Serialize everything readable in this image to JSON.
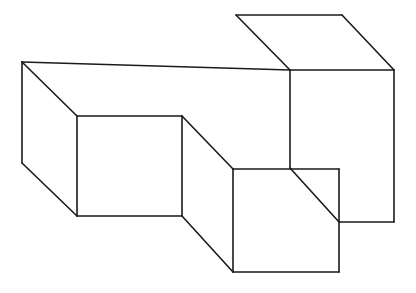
{
  "document": {
    "title": "Isometric Block Line Drawing",
    "background_color": "#ffffff",
    "line_color": "#1a1a1a",
    "fill_color": "#ffffff",
    "stroke_width": 1.6,
    "width": 416,
    "height": 293,
    "subject": "three-dimensional stepped rectangular solid drawn in oblique projection",
    "text_content": ""
  },
  "figure": {
    "name": "stepped-block-solid",
    "projection": "oblique / parallel",
    "vertices": {
      "A": [
        22,
        62
      ],
      "B": [
        77,
        116
      ],
      "C": [
        182,
        116
      ],
      "D": [
        233,
        169
      ],
      "E": [
        290,
        70
      ],
      "F": [
        236,
        15
      ],
      "G": [
        342,
        15
      ],
      "H": [
        394,
        70
      ],
      "I": [
        22,
        163
      ],
      "J": [
        77,
        216
      ],
      "K": [
        182,
        216
      ],
      "L": [
        233,
        272
      ],
      "M": [
        339,
        272
      ],
      "N": [
        339,
        222
      ],
      "O": [
        394,
        222
      ],
      "P": [
        339,
        169
      ]
    },
    "faces": [
      {
        "name": "top-left-plateau-face",
        "points": "22,62 290,70 236,15"
      },
      {
        "name": "upper-block-top-face",
        "points": "236,15 342,15 394,70 290,70"
      },
      {
        "name": "left-front-face",
        "points": "77,116 182,116 182,216 77,216"
      },
      {
        "name": "left-side-face",
        "points": "22,62 77,116 77,216 22,163"
      },
      {
        "name": "middle-front-face",
        "points": "233,169 339,169 339,272 233,272"
      },
      {
        "name": "middle-side-face",
        "points": "182,116 233,169 233,272 182,216"
      },
      {
        "name": "right-block-front-face",
        "points": "290,70 394,70 394,222 339,222 339,169"
      }
    ],
    "edges": [
      {
        "name": "edge-A-B",
        "from": "A",
        "to": "B",
        "d": "M 22 62 L 77 116"
      },
      {
        "name": "edge-A-I",
        "from": "A",
        "to": "I",
        "d": "M 22 62 L 22 163"
      },
      {
        "name": "edge-A-E-top-left-plateau",
        "from": "A",
        "to": "E",
        "d": "M 22 62 L 290 70"
      },
      {
        "name": "edge-I-J",
        "from": "I",
        "to": "J",
        "d": "M 22 163 L 77 216"
      },
      {
        "name": "edge-B-C",
        "from": "B",
        "to": "C",
        "d": "M 77 116 L 182 116"
      },
      {
        "name": "edge-B-J",
        "from": "B",
        "to": "J",
        "d": "M 77 116 L 77 216"
      },
      {
        "name": "edge-J-K",
        "from": "J",
        "to": "K",
        "d": "M 77 216 L 182 216"
      },
      {
        "name": "edge-C-K",
        "from": "C",
        "to": "K",
        "d": "M 182 116 L 182 216"
      },
      {
        "name": "edge-C-D-diagonal",
        "from": "C",
        "to": "D",
        "d": "M 182 116 L 233 169"
      },
      {
        "name": "edge-K-L-diagonal",
        "from": "K",
        "to": "L",
        "d": "M 182 216 L 233 272"
      },
      {
        "name": "edge-D-P",
        "from": "D",
        "to": "P",
        "d": "M 233 169 L 339 169"
      },
      {
        "name": "edge-D-L",
        "from": "D",
        "to": "L",
        "d": "M 233 169 L 233 272"
      },
      {
        "name": "edge-L-M",
        "from": "L",
        "to": "M",
        "d": "M 233 272 L 339 272"
      },
      {
        "name": "edge-P-M",
        "from": "P",
        "to": "M",
        "d": "M 339 169 L 339 272"
      },
      {
        "name": "edge-E-F",
        "from": "E",
        "to": "F",
        "d": "M 290 70 L 236 15"
      },
      {
        "name": "edge-F-G",
        "from": "F",
        "to": "G",
        "d": "M 236 15 L 342 15"
      },
      {
        "name": "edge-G-H-diagonal",
        "from": "G",
        "to": "H",
        "d": "M 342 15 L 394 70"
      },
      {
        "name": "edge-E-H-top-right",
        "from": "E",
        "to": "H",
        "d": "M 290 70 L 394 70"
      },
      {
        "name": "edge-E-N-vertical",
        "from": "E",
        "to": "N",
        "d": "M 290 70 L 290 168"
      },
      {
        "name": "edge-H-O-vertical",
        "from": "H",
        "to": "O",
        "d": "M 394 70 L 394 222"
      },
      {
        "name": "edge-N-O-bottom",
        "from": "N",
        "to": "O",
        "d": "M 339 222 L 394 222"
      },
      {
        "name": "edge-E-D-inner-diagonal",
        "from": "E",
        "to": "N",
        "d": "M 290 168 L 339 222"
      }
    ]
  }
}
